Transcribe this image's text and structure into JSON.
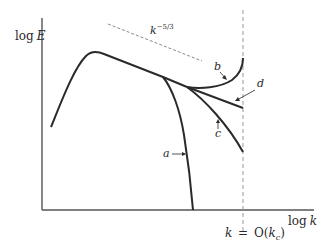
{
  "diagram": {
    "type": "energy-spectrum-sketch",
    "axes": {
      "y_label": "log E",
      "y_label_parts": {
        "fn": "log",
        "var": "E"
      },
      "x_label": "log k",
      "x_label_parts": {
        "fn": "log",
        "var": "k"
      }
    },
    "slope_reference": {
      "label": "k^-5/3",
      "base": "k",
      "exponent": "−5/3",
      "style": "dashed"
    },
    "cutoff": {
      "label": "k = O(k_c)",
      "parts": {
        "lhs": "k",
        "eq": "=",
        "rhs_fn": "O(",
        "rhs_var": "k",
        "rhs_sub": "c",
        "close": ")"
      },
      "style": "dashed vertical"
    },
    "curves": [
      {
        "id": "a",
        "label": "a",
        "description": "spectrum dropping sharply to zero"
      },
      {
        "id": "b",
        "label": "b",
        "description": "spectrum turning upward at cutoff"
      },
      {
        "id": "c",
        "label": "c",
        "description": "spectrum bending downward"
      },
      {
        "id": "d",
        "label": "d",
        "description": "spectrum continuing the inertial slope"
      }
    ],
    "colors": {
      "curve": "#2a2a2a",
      "axis": "#555555",
      "dashed": "#888888"
    }
  }
}
